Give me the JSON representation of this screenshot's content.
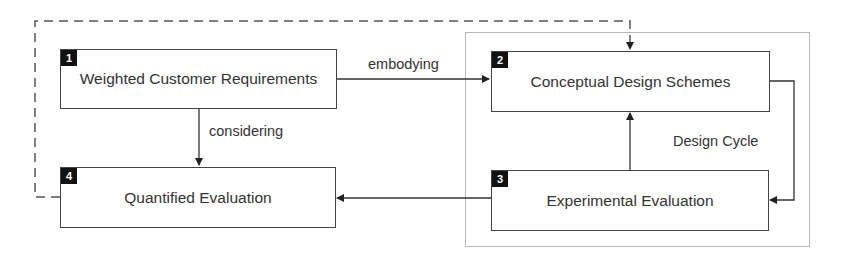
{
  "diagram": {
    "nodes": [
      {
        "id": 1,
        "badge": "1",
        "label": "Weighted Customer Requirements"
      },
      {
        "id": 2,
        "badge": "2",
        "label": "Conceptual Design Schemes"
      },
      {
        "id": 3,
        "badge": "3",
        "label": "Experimental Evaluation"
      },
      {
        "id": 4,
        "badge": "4",
        "label": "Quantified Evaluation"
      }
    ],
    "edges": [
      {
        "from": 1,
        "to": 2,
        "label": "embodying",
        "style": "solid"
      },
      {
        "from": 1,
        "to": 4,
        "label": "considering",
        "style": "solid"
      },
      {
        "from": 2,
        "to": 3,
        "label": "",
        "style": "solid"
      },
      {
        "from": 3,
        "to": 2,
        "label": "",
        "style": "solid"
      },
      {
        "from": 3,
        "to": 4,
        "label": "",
        "style": "solid"
      },
      {
        "from": 4,
        "to": 2,
        "label": "",
        "style": "dashed"
      }
    ],
    "group": {
      "label": "Design Cycle",
      "members": [
        2,
        3
      ]
    },
    "colors": {
      "box_border": "#444444",
      "badge_bg": "#111111",
      "group_border": "#b8b8b8",
      "text": "#333333"
    }
  }
}
